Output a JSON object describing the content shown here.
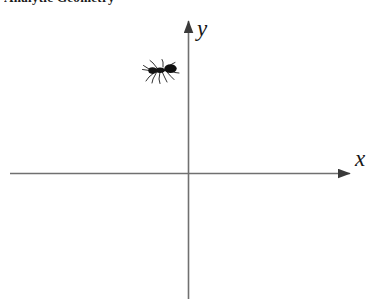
{
  "header": {
    "text": "Analytic Geometry"
  },
  "diagram": {
    "background_color": "#ffffff",
    "axis_color": "#6e6e6e",
    "label_color": "#161616",
    "axes": [
      {
        "name": "x-axis",
        "label": "x",
        "direction": "horizontal",
        "arrow": "right",
        "start_px": [
          10,
          173
        ],
        "end_px": [
          356,
          173
        ]
      },
      {
        "name": "y-axis",
        "label": "y",
        "direction": "vertical",
        "arrow": "up",
        "start_px": [
          188,
          299
        ],
        "end_px": [
          188,
          15
        ]
      }
    ],
    "origin_px": [
      188,
      173
    ],
    "objects": [
      {
        "name": "ant",
        "label": "ant",
        "quadrant": "II",
        "position_px": [
          161,
          72
        ],
        "color": "#111111"
      }
    ]
  }
}
